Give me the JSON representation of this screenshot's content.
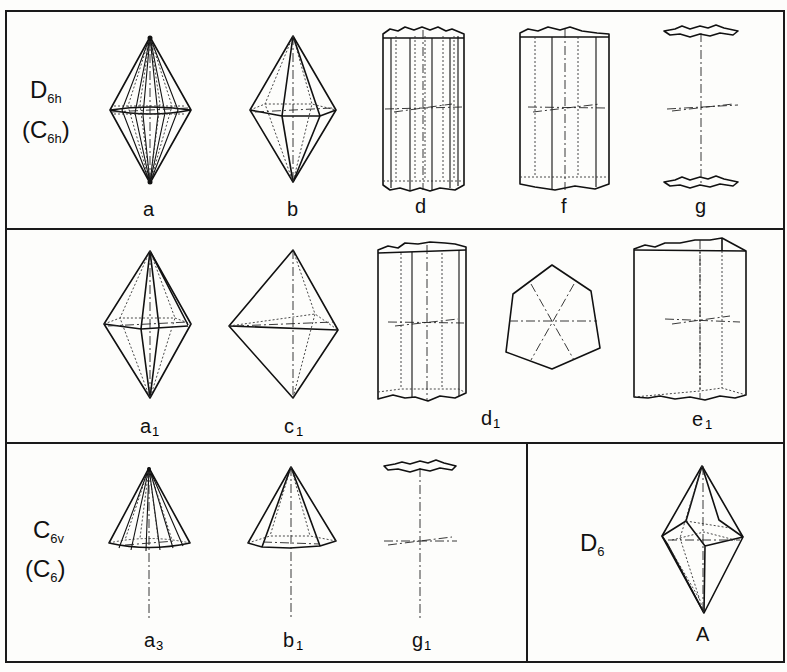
{
  "figure": {
    "panels": [
      {
        "id": "row1",
        "group_label": {
          "main": "D",
          "sub": "6h"
        },
        "alt_label": {
          "main": "(C",
          "sub": "6h",
          "close": ")"
        },
        "forms": [
          {
            "key": "a",
            "label": "a",
            "shape": "dihexagonal bipyramid"
          },
          {
            "key": "b",
            "label": "b",
            "shape": "hexagonal bipyramid"
          },
          {
            "key": "d",
            "label": "d",
            "shape": "dihexagonal prism"
          },
          {
            "key": "f",
            "label": "f",
            "shape": "hexagonal prism"
          },
          {
            "key": "g",
            "label": "g",
            "shape": "pinacoid"
          }
        ]
      },
      {
        "id": "row2",
        "forms": [
          {
            "key": "a1",
            "label": "a",
            "sub": "1",
            "shape": "ditrigonal bipyramid"
          },
          {
            "key": "c1",
            "label": "c",
            "sub": "1",
            "shape": "trigonal bipyramid"
          },
          {
            "key": "d1",
            "label": "d",
            "sub": "1",
            "shape": "ditrigonal prism"
          },
          {
            "key": "d1-section",
            "label": "",
            "shape": "ditrigonal cross-section"
          },
          {
            "key": "e1",
            "label": "e",
            "sub": "1",
            "shape": "trigonal prism"
          }
        ]
      },
      {
        "id": "row3",
        "group_label": {
          "main": "C",
          "sub": "6v"
        },
        "alt_label": {
          "main": "(C",
          "sub": "6",
          "close": ")"
        },
        "forms": [
          {
            "key": "a3",
            "label": "a",
            "sub": "3",
            "shape": "dihexagonal pyramid"
          },
          {
            "key": "b1",
            "label": "b",
            "sub": "1",
            "shape": "hexagonal pyramid"
          },
          {
            "key": "g1",
            "label": "g",
            "sub": "1",
            "shape": "pedion"
          }
        ]
      },
      {
        "id": "row3-right",
        "group_label": {
          "main": "D",
          "sub": "6"
        },
        "forms": [
          {
            "key": "A",
            "label": "A",
            "shape": "hexagonal trapezohedron"
          }
        ]
      }
    ]
  }
}
